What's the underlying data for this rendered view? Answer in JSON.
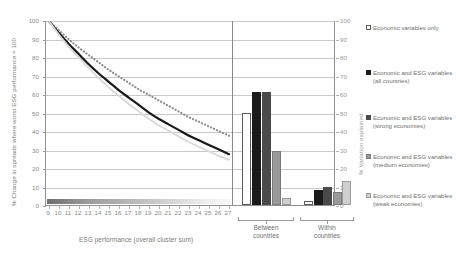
{
  "chart_data": [
    {
      "type": "line",
      "title": "",
      "xlabel": "ESG performance (overall cluster sum)",
      "ylabel": "% Change in spreads where worst ESG performance = 100",
      "ylim": [
        0,
        100
      ],
      "yticks": [
        0,
        10,
        20,
        30,
        40,
        50,
        60,
        70,
        80,
        90,
        100
      ],
      "x": [
        9,
        10,
        11,
        12,
        13,
        14,
        15,
        16,
        17,
        18,
        19,
        20,
        21,
        22,
        23,
        24,
        25,
        26,
        27
      ],
      "xticks": [
        "9",
        "10",
        "11",
        "12",
        "13",
        "14",
        "15",
        "16",
        "17",
        "18",
        "19",
        "20",
        "21",
        "22",
        "23",
        "24",
        "25",
        "26",
        "27"
      ],
      "grid": true,
      "legend_position": "right",
      "series": [
        {
          "name": "Economic and ESG variables (all countries)",
          "style": "dotted",
          "color": "#8c8c8c",
          "values": [
            100,
            95,
            90,
            85.5,
            81.5,
            77.5,
            73.5,
            70,
            66.5,
            63,
            60,
            57,
            54,
            51,
            48,
            45.5,
            43,
            40.5,
            38
          ]
        },
        {
          "name": "Economic and ESG variables (strong economies)",
          "style": "solid",
          "color": "#1a1a1a",
          "values": [
            100,
            93.5,
            87.5,
            82,
            76.5,
            71.5,
            67,
            62.5,
            58.5,
            54.5,
            50.5,
            47,
            44,
            41,
            38,
            35.5,
            33,
            30.5,
            28
          ]
        },
        {
          "name": "Economic and ESG variables (weak economies)",
          "style": "solid",
          "color": "#d9d9d9",
          "values": [
            100,
            92.5,
            86,
            80,
            74.5,
            69,
            64,
            59.5,
            55,
            51,
            47,
            43.5,
            40.5,
            37.5,
            34.5,
            32,
            29.5,
            27,
            25
          ]
        }
      ]
    },
    {
      "type": "bar",
      "title": "",
      "xlabel": "",
      "ylabel": "% Variation explained",
      "ylim": [
        0,
        100
      ],
      "yticks": [
        0,
        10,
        20,
        30,
        40,
        50,
        60,
        70,
        80,
        90,
        100
      ],
      "categories": [
        "Between countries",
        "Within countries"
      ],
      "grid": true,
      "legend_position": "right",
      "series": [
        {
          "name": "Economic variables only",
          "color": "#ffffff",
          "border": "#5a5a5a",
          "values": [
            50,
            2
          ]
        },
        {
          "name": "Economic and ESG variables (all countries)",
          "color": "#1a1a1a",
          "border": "#1a1a1a",
          "values": [
            61,
            8
          ]
        },
        {
          "name": "Economic and ESG variables (strong economies)",
          "color": "#4a4a4a",
          "border": "#4a4a4a",
          "values": [
            61,
            10
          ]
        },
        {
          "name": "Economic and ESG variables (medium economies)",
          "color": "#9a9a9a",
          "border": "#7a7a7a",
          "values": [
            29,
            7
          ]
        },
        {
          "name": "Economic and ESG variables (weak economies)",
          "color": "#cfcfcf",
          "border": "#9a9a9a",
          "values": [
            4,
            13
          ]
        }
      ]
    }
  ],
  "axes": {
    "left_title": "% Change in spreads where worst ESG performance = 100",
    "right_title": "% Variation explained",
    "bottom_title": "ESG performance (overall cluster sum)",
    "left_ticks": [
      "100",
      "90",
      "80",
      "70",
      "60",
      "50",
      "40",
      "30",
      "20",
      "10",
      "0"
    ],
    "right_ticks": [
      "100",
      "90",
      "80",
      "70",
      "60",
      "50",
      "40",
      "30",
      "20",
      "10",
      "0"
    ],
    "bottom_ticks": [
      "9",
      "10",
      "11",
      "12",
      "13",
      "14",
      "15",
      "16",
      "17",
      "18",
      "19",
      "20",
      "21",
      "22",
      "23",
      "24",
      "25",
      "26",
      "27"
    ]
  },
  "groups": [
    {
      "label": "Between\ncountries"
    },
    {
      "label": "Within\ncountries"
    }
  ],
  "legend": {
    "items": [
      {
        "label": "Economic variables only",
        "swatch": "#ffffff",
        "border": "#5a5a5a"
      },
      {
        "label": "Economic and ESG variables (all countries)",
        "swatch": "#1a1a1a",
        "border": "#1a1a1a"
      },
      {
        "label": "Economic and ESG variables (strong economies)",
        "swatch": "#4a4a4a",
        "border": "#4a4a4a"
      },
      {
        "label": "Economic and ESG variables (medium economies)",
        "swatch": "#9a9a9a",
        "border": "#7a7a7a"
      },
      {
        "label": "Economic and ESG variables (weak economies)",
        "swatch": "#cfcfcf",
        "border": "#9a9a9a"
      }
    ]
  }
}
